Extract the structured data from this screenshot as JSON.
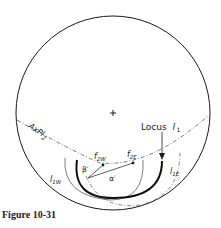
{
  "figure": {
    "caption": "Figure 10-31",
    "labels": {
      "axial_plane": "AxPl",
      "axial_plane_sub": "2",
      "locus": "Locus",
      "locus_symbol": "l",
      "locus_sub": "1",
      "locus_prime": "′",
      "f2w": "f",
      "f2w_sub": "2W",
      "f2e": "f",
      "f2e_sub": "2E",
      "l1w": "l",
      "l1w_sub": "1W",
      "l1e": "l",
      "l1e_sub": "1E",
      "alpha": "α′",
      "beta": "β′",
      "center_mark": "+"
    },
    "colors": {
      "ink": "#1a1a1a",
      "background": "#ffffff"
    }
  }
}
